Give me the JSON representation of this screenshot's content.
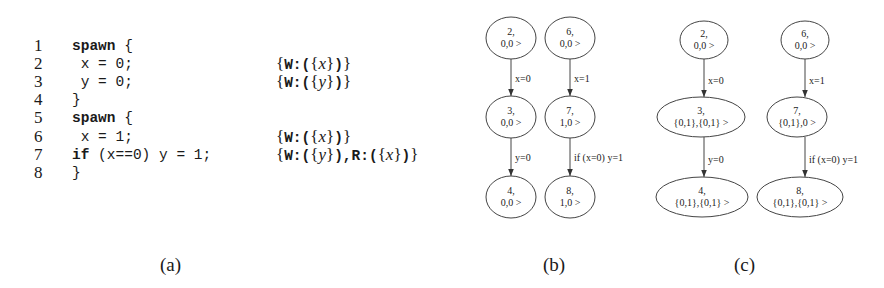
{
  "figure_a": {
    "caption": "(a)",
    "lines": [
      {
        "num": "1",
        "keyword": "spawn",
        "code": " {",
        "annotation": null
      },
      {
        "num": "2",
        "keyword": "",
        "code": " x = 0;",
        "annotation": {
          "parts": [
            "W:",
            "x"
          ]
        }
      },
      {
        "num": "3",
        "keyword": "",
        "code": " y = 0;",
        "annotation": {
          "parts": [
            "W:",
            "y"
          ]
        }
      },
      {
        "num": "4",
        "keyword": "",
        "code": "}",
        "annotation": null
      },
      {
        "num": "5",
        "keyword": "spawn",
        "code": " {",
        "annotation": null
      },
      {
        "num": "6",
        "keyword": "",
        "code": " x = 1;",
        "annotation": {
          "parts": [
            "W:",
            "x"
          ]
        }
      },
      {
        "num": "7",
        "keyword": "if",
        "code": " (x==0) y = 1;",
        "annotation": {
          "parts": [
            "W:",
            "y",
            "R:",
            "x"
          ]
        }
      },
      {
        "num": "8",
        "keyword": "",
        "code": "}",
        "annotation": null
      }
    ]
  },
  "figure_b": {
    "caption": "(b)",
    "nodes": [
      {
        "id": "2",
        "l1": "2,",
        "l2": "0,0 >"
      },
      {
        "id": "3",
        "l1": "3,",
        "l2": "0,0 >"
      },
      {
        "id": "4",
        "l1": "4,",
        "l2": "0,0 >"
      },
      {
        "id": "6",
        "l1": "6,",
        "l2": "0,0 >"
      },
      {
        "id": "7",
        "l1": "7,",
        "l2": "1,0 >"
      },
      {
        "id": "8",
        "l1": "8,",
        "l2": "1,0 >"
      }
    ],
    "edges": [
      {
        "from": "2",
        "to": "3",
        "label": "x=0"
      },
      {
        "from": "3",
        "to": "4",
        "label": "y=0"
      },
      {
        "from": "6",
        "to": "7",
        "label": "x=1"
      },
      {
        "from": "7",
        "to": "8",
        "label": "if (x=0) y=1"
      }
    ]
  },
  "figure_c": {
    "caption": "(c)",
    "nodes": [
      {
        "id": "2",
        "l1": "2,",
        "l2": "0,0 >"
      },
      {
        "id": "3",
        "l1": "3,",
        "l2": "{0,1},{0,1} >"
      },
      {
        "id": "4",
        "l1": "4,",
        "l2": "{0,1},{0,1} >"
      },
      {
        "id": "6",
        "l1": "6,",
        "l2": "0,0 >"
      },
      {
        "id": "7",
        "l1": "7,",
        "l2": "{0,1},0 >"
      },
      {
        "id": "8",
        "l1": "8,",
        "l2": "{0,1},{0,1} >"
      }
    ],
    "edges": [
      {
        "from": "2",
        "to": "3",
        "label": "x=0"
      },
      {
        "from": "3",
        "to": "4",
        "label": "y=0"
      },
      {
        "from": "6",
        "to": "7",
        "label": "x=1"
      },
      {
        "from": "7",
        "to": "8",
        "label": "if (x=0) y=1"
      }
    ]
  }
}
